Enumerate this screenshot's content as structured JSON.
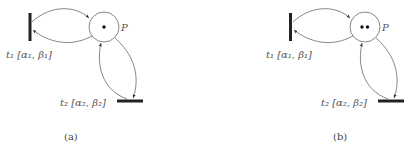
{
  "panels": [
    {
      "caption": "(a)",
      "place_label": "P",
      "tokens": 1,
      "t1_label": "t₁ [α₁, β₁]",
      "t2_label": "t₂ [α₂, β₂]"
    },
    {
      "caption": "(b)",
      "place_label": "P",
      "tokens": 2,
      "t1_label": "t₁ [α₁, β₁]",
      "t2_label": "t₂ [α₂, β₂]"
    }
  ]
}
